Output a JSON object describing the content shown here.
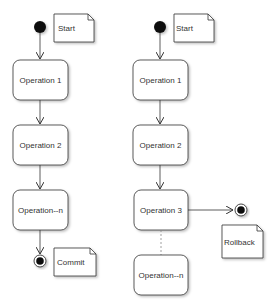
{
  "diagram": {
    "type": "uml-activity",
    "colors": {
      "background": "#ffffff",
      "stroke": "#333333",
      "fill": "#ffffff",
      "node_dot": "#111111",
      "dashed_line": "#888888"
    },
    "left_flow": {
      "start_note": "Start",
      "operations": [
        "Operation 1",
        "Operation 2",
        "Operation--n"
      ],
      "end_note": "Commit"
    },
    "right_flow": {
      "start_note": "Start",
      "operations": [
        "Operation 1",
        "Operation 2",
        "Operation 3",
        "Operation--n"
      ],
      "branch_end_note": "Rollback"
    }
  }
}
